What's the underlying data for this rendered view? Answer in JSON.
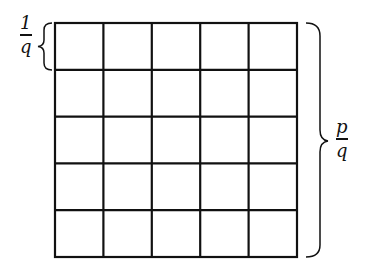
{
  "diagram": {
    "grid": {
      "rows": 5,
      "cols": 5,
      "stroke": "#111111"
    },
    "left_label": {
      "numerator": "1",
      "denominator": "q"
    },
    "right_label": {
      "numerator": "p",
      "denominator": "q"
    }
  }
}
